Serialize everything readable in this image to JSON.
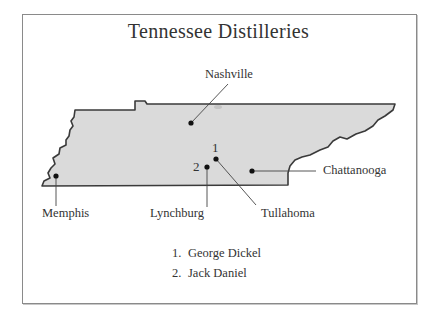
{
  "title": "Tennessee Distilleries",
  "map": {
    "region": "Tennessee",
    "fill_color": "#d9d9d9",
    "outline_color": "#3a3a3a",
    "cities": [
      {
        "name": "Nashville",
        "label": "Nashville"
      },
      {
        "name": "Memphis",
        "label": "Memphis"
      },
      {
        "name": "Lynchburg",
        "label": "Lynchburg"
      },
      {
        "name": "Tullahoma",
        "label": "Tullahoma"
      },
      {
        "name": "Chattanooga",
        "label": "Chattanooga"
      }
    ],
    "markers": [
      {
        "number": "1",
        "location": "Tullahoma"
      },
      {
        "number": "2",
        "location": "Lynchburg"
      }
    ]
  },
  "legend": {
    "items": [
      {
        "number": "1.",
        "label": "George Dickel"
      },
      {
        "number": "2.",
        "label": "Jack Daniel"
      }
    ]
  }
}
